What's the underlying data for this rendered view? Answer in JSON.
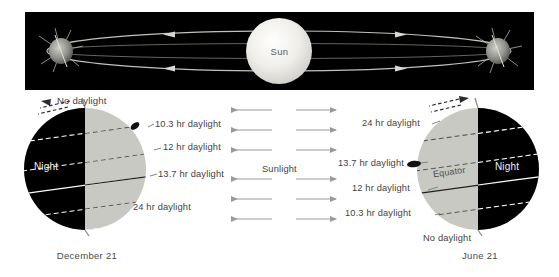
{
  "figure": {
    "title_absent": true,
    "background_color": "#ffffff"
  },
  "orbit_panel": {
    "background_color": "#000000",
    "sun_label": "Sun",
    "sun_color": "#e8e7e2",
    "orbit_line_color": "#b9b9b4",
    "earth_positions": [
      "left",
      "right"
    ],
    "arrow_count": 4
  },
  "sunlight": {
    "label": "Sunlight",
    "arrow_rows": 6,
    "arrow_color": "#9a9a9a",
    "left_arrow_direction": "left",
    "right_arrow_direction": "right"
  },
  "left_globe": {
    "caption": "December 21",
    "night_label": "Night",
    "night_color": "#000000",
    "day_color": "#c9c9c4",
    "top_label": "No daylight",
    "labels": [
      "10.3 hr daylight",
      "12 hr daylight",
      "13.7 hr daylight",
      "24 hr daylight"
    ],
    "axis_label_icon": "rotation-arrow-icon"
  },
  "right_globe": {
    "caption": "June 21",
    "night_label": "Night",
    "equator_label": "Equator",
    "night_color": "#000000",
    "day_color": "#c9c9c4",
    "bottom_label": "No daylight",
    "labels": [
      "24 hr daylight",
      "13.7 hr daylight",
      "12 hr daylight",
      "10.3 hr daylight"
    ],
    "axis_label_icon": "rotation-arrow-icon"
  }
}
